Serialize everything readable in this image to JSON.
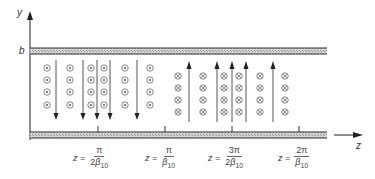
{
  "figure": {
    "axes": {
      "y_label": "y",
      "z_label": "z",
      "top_plate_label": "b"
    },
    "colors": {
      "line": "#333333",
      "plate_fill": "#bdbdbd",
      "symbol": "#666666"
    },
    "e_field_arrows": {
      "down": [
        31,
        58,
        71,
        84,
        111
      ],
      "up": [
        188,
        215,
        230,
        245,
        272
      ]
    },
    "h_field_columns": {
      "out_of_page": [
        47,
        70,
        91,
        106,
        126,
        150
      ],
      "into_page": [
        180,
        203,
        224,
        239,
        260,
        285
      ]
    },
    "field_symbols": {
      "out_of_page": "dot-in-circle",
      "into_page": "cross-in-circle"
    },
    "z_ticks": [
      {
        "eq": "z =",
        "num": "π",
        "den_coef": "2",
        "den_sym": "β",
        "den_sub": "10"
      },
      {
        "eq": "z =",
        "num": "π",
        "den_coef": "",
        "den_sym": "β",
        "den_sub": "10"
      },
      {
        "eq": "z =",
        "num": "3π",
        "den_coef": "2",
        "den_sym": "β",
        "den_sub": "10"
      },
      {
        "eq": "z =",
        "num": "2π",
        "den_coef": "",
        "den_sym": "β",
        "den_sub": "10"
      }
    ]
  }
}
